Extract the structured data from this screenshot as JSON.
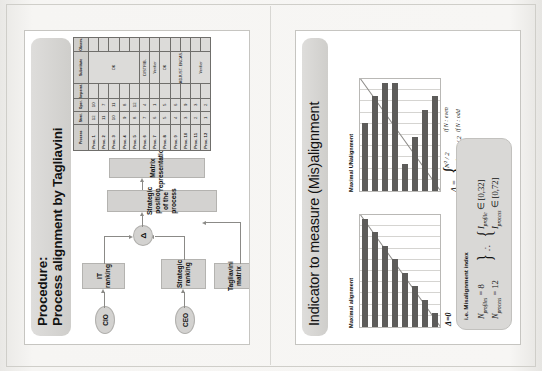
{
  "document": {
    "type": "scanned-page-two-slides",
    "orientation": "slides rotated 90 degrees counter-clockwise"
  },
  "slide_left": {
    "title_line1": "Procedure:",
    "title_line2": "Process alignment by Tagliavini",
    "flow": {
      "cio": "CIO",
      "ceo": "CEO",
      "it_ranking": "IT ranking",
      "strategic_ranking": "Strategic ranking",
      "tagliavini_matrix": "Tagliavini matrix",
      "delta": "Δ",
      "strategic_position": "Strategic position of the process",
      "matrix_representation": "Matrix representation"
    },
    "table": {
      "headers": [
        "Process",
        "Strat.",
        "Oper.",
        "Imperat.",
        "Substitute",
        "Observ."
      ],
      "rows": [
        {
          "name": "Proc. 1",
          "strat": "12",
          "oper": "10",
          "imperat": "",
          "substitute": "OK",
          "observ": ""
        },
        {
          "name": "Proc. 2",
          "strat": "11",
          "oper": "7",
          "imperat": "",
          "substitute": "OK",
          "observ": ""
        },
        {
          "name": "Proc. 3",
          "strat": "10",
          "oper": "11",
          "imperat": "",
          "substitute": "OK",
          "observ": ""
        },
        {
          "name": "Proc. 4",
          "strat": "9",
          "oper": "8",
          "imperat": "",
          "substitute": "OK",
          "observ": ""
        },
        {
          "name": "Proc. 5",
          "strat": "8",
          "oper": "12",
          "imperat": "",
          "substitute": "OK",
          "observ": ""
        },
        {
          "name": "Proc. 6",
          "strat": "7",
          "oper": "4",
          "imperat": "",
          "substitute": "DISTRIB.",
          "observ": ""
        },
        {
          "name": "Proc. 7",
          "strat": "6",
          "oper": "1",
          "imperat": "",
          "substitute": "Verifier",
          "observ": ""
        },
        {
          "name": "Proc. 8",
          "strat": "5",
          "oper": "5",
          "imperat": "",
          "substitute": "OK",
          "observ": ""
        },
        {
          "name": "Proc. 9",
          "strat": "4",
          "oper": "6",
          "imperat": "",
          "substitute": "ADJUST. ENCAS.",
          "observ": ""
        },
        {
          "name": "Proc. 10",
          "strat": "3",
          "oper": "9",
          "imperat": "",
          "substitute": "ADJUST. ENCAS.",
          "observ": ""
        },
        {
          "name": "Proc. 11",
          "strat": "2",
          "oper": "3",
          "imperat": "",
          "substitute": "Verifier",
          "observ": ""
        },
        {
          "name": "Proc. 12",
          "strat": "1",
          "oper": "2",
          "imperat": "",
          "substitute": "Verifier",
          "observ": ""
        }
      ]
    }
  },
  "slide_right": {
    "title": "Indicator to measure (Mis)alignment",
    "chart_left_caption": "Maximal alignment",
    "chart_right_caption": "Maximal UNalignment",
    "delta_zero": "Δ=0",
    "formula": {
      "lhs": "Δ =",
      "case1_value": "N² / 2",
      "case1_cond": "if N : even",
      "case2_value": "(N² − 1) / 2",
      "case2_cond": "if N : odd"
    },
    "index_box": {
      "heading": "i.e. Misalignment index",
      "n_profile_label": "N",
      "n_profile_sub": "profiles",
      "n_profile_value": "= 8",
      "n_process_label": "N",
      "n_process_sub": "process",
      "n_process_value": "= 12",
      "therefore": "∴",
      "i_profile_label": "I",
      "i_profile_sub": "profile",
      "i_profile_in": "∈",
      "i_profile_range": "[0,32]",
      "i_process_label": "I",
      "i_process_sub": "process",
      "i_process_in": "∈",
      "i_process_range": "[0,72]"
    }
  },
  "chart_data": [
    {
      "type": "bar",
      "title": "Maximal alignment",
      "orientation": "horizontal",
      "categories": [
        "1",
        "2",
        "3",
        "4",
        "5",
        "6",
        "7",
        "8"
      ],
      "values": [
        8,
        7,
        6,
        5,
        4,
        3,
        2,
        1
      ],
      "xlabel": "",
      "ylabel": "",
      "grid": true,
      "annotation": "Δ=0",
      "note": "bars form a perfect descending staircase aligned with the diagonal reference line"
    },
    {
      "type": "bar",
      "title": "Maximal UNalignment",
      "orientation": "horizontal",
      "categories": [
        "1",
        "2",
        "3",
        "4",
        "5",
        "6",
        "7",
        "8"
      ],
      "values": [
        5,
        7,
        8,
        8,
        2,
        4,
        6,
        7
      ],
      "xlabel": "",
      "ylabel": "",
      "grid": true,
      "note": "bars deviate strongly from the diagonal reference line"
    }
  ]
}
